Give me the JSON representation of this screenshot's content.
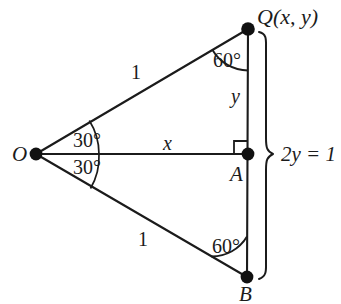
{
  "figure": {
    "kind": "geometry-diagram",
    "stroke_color": "#1b1b1b",
    "background_color": "#ffffff"
  },
  "vertices": {
    "O": {
      "label": "O",
      "x": 36,
      "y": 154
    },
    "A": {
      "label": "A",
      "x": 248,
      "y": 154
    },
    "B": {
      "label": "B",
      "x": 247,
      "y": 277
    },
    "Q": {
      "label": "Q(x, y)",
      "x": 248,
      "y": 29
    }
  },
  "segments": {
    "oq_length_label": "1",
    "ob_length_label": "1",
    "oa_label": "x",
    "aq_label": "y"
  },
  "angles": {
    "at_o_upper": "30°",
    "at_o_lower": "30°",
    "at_q": "60°",
    "at_b": "60°",
    "right_angle_at_a": "90°"
  },
  "brace": {
    "label": "2y = 1",
    "spans_from": "Q",
    "spans_to": "B"
  }
}
